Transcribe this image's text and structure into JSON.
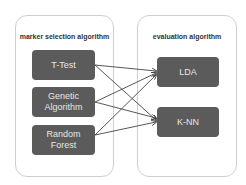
{
  "left_panel": {
    "title": "marker selection algorithm",
    "nodes": [
      {
        "label": "T-Test"
      },
      {
        "label": "Genetic\nAlgorithm"
      },
      {
        "label": "Random\nForest"
      }
    ]
  },
  "right_panel": {
    "title": "evaluation algorithm",
    "nodes": [
      {
        "label": "LDA"
      },
      {
        "label": "K-NN"
      }
    ]
  },
  "edges": [
    {
      "from": "T-Test",
      "to": "LDA"
    },
    {
      "from": "T-Test",
      "to": "K-NN"
    },
    {
      "from": "Genetic Algorithm",
      "to": "LDA"
    },
    {
      "from": "Genetic Algorithm",
      "to": "K-NN"
    },
    {
      "from": "Random Forest",
      "to": "LDA"
    },
    {
      "from": "Random Forest",
      "to": "K-NN"
    }
  ],
  "colors": {
    "node_fill": "#5b5b5b",
    "node_text": "#e6e6e6",
    "panel_border": "#cfcfcf",
    "edge": "#444444"
  }
}
